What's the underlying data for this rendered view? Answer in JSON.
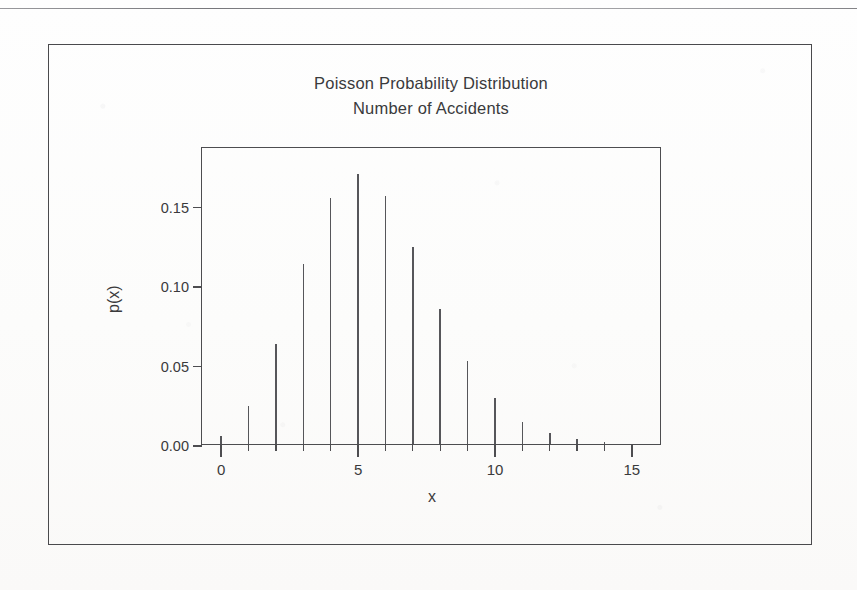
{
  "page": {
    "background_color": "#fdfdfc",
    "ink_color": "#4a4a4d"
  },
  "figure": {
    "title_line_1": "Poisson Probability Distribution",
    "title_line_2": "Number of Accidents"
  },
  "chart_data": {
    "type": "bar",
    "title": "Poisson Probability Distribution\nNumber of Accidents",
    "subtitle": "Number of Accidents",
    "xlabel": "x",
    "ylabel": "p(x)",
    "x": [
      0,
      1,
      2,
      3,
      4,
      5,
      6,
      7,
      8,
      9,
      10,
      11,
      12,
      13,
      14,
      15
    ],
    "values": [
      0.005,
      0.024,
      0.063,
      0.113,
      0.155,
      0.17,
      0.156,
      0.124,
      0.085,
      0.052,
      0.029,
      0.014,
      0.007,
      0.003,
      0.001,
      0.0
    ],
    "categories": [
      "0",
      "1",
      "2",
      "3",
      "4",
      "5",
      "6",
      "7",
      "8",
      "9",
      "10",
      "11",
      "12",
      "13",
      "14",
      "15"
    ],
    "xlim": [
      -0.7,
      16.1
    ],
    "ylim": [
      0.0,
      0.1875
    ],
    "x_ticks_major": [
      0,
      5,
      10,
      15
    ],
    "x_tick_labels": [
      "0",
      "5",
      "10",
      "15"
    ],
    "x_ticks_minor": [
      0,
      1,
      2,
      3,
      4,
      5,
      6,
      7,
      8,
      9,
      10,
      11,
      12,
      13,
      14,
      15
    ],
    "y_ticks": [
      0.0,
      0.05,
      0.1,
      0.15
    ],
    "y_tick_labels": [
      "0.00",
      "0.05",
      "0.10",
      "0.15"
    ],
    "grid": false,
    "legend": false,
    "series_color": "#56565a",
    "style": "spike / impulse plot"
  }
}
